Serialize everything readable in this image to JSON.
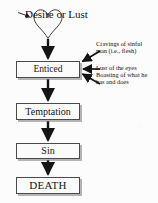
{
  "diagram": {
    "title_shape": {
      "icon": "heart-shape",
      "label": "Desire or Lust"
    },
    "nodes": [
      {
        "id": "enticed",
        "label": "Enticed"
      },
      {
        "id": "temptation",
        "label": "Temptation"
      },
      {
        "id": "sin",
        "label": "Sin"
      },
      {
        "id": "death",
        "label": "DEATH"
      }
    ],
    "annotations": [
      {
        "id": "cravings",
        "text": "Cravings of sinful\nman (i.e., flesh)"
      },
      {
        "id": "lust",
        "text": "Lust of the eyes"
      },
      {
        "id": "boasting",
        "text": "Boasting of what he\nhas and does"
      }
    ],
    "colors": {
      "ink": "#151515",
      "box_border": "#4a4a4a",
      "box_fill": "#fbfbfb",
      "box_shadow": "#787878",
      "page": "#fcfcfc"
    }
  }
}
